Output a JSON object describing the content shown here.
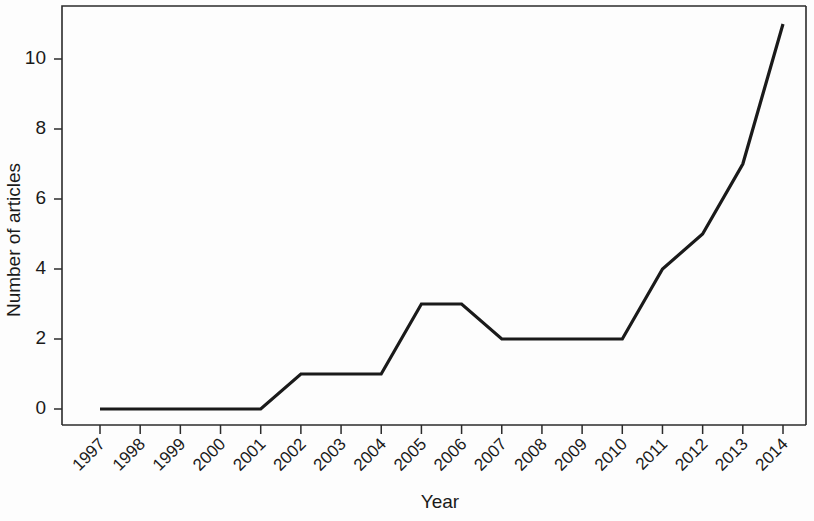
{
  "chart_data": {
    "type": "line",
    "title": "",
    "subtitle": "",
    "xlabel": "Year",
    "ylabel": "Number of articles",
    "categories": [
      "1997",
      "1998",
      "1999",
      "2000",
      "2001",
      "2002",
      "2003",
      "2004",
      "2005",
      "2006",
      "2007",
      "2008",
      "2009",
      "2010",
      "2011",
      "2012",
      "2013",
      "2014"
    ],
    "values": [
      0,
      0,
      0,
      0,
      0,
      1,
      1,
      1,
      3,
      3,
      2,
      2,
      2,
      2,
      4,
      5,
      7,
      11
    ],
    "series": [
      {
        "name": "Number of articles",
        "values": [
          0,
          0,
          0,
          0,
          0,
          1,
          1,
          1,
          3,
          3,
          2,
          2,
          2,
          2,
          4,
          5,
          7,
          11
        ]
      }
    ],
    "ylim": [
      0,
      11.7
    ],
    "xlim": [
      1997,
      2014
    ],
    "y_ticks": [
      0,
      2,
      4,
      6,
      8,
      10
    ],
    "y_tick_labels": [
      "0",
      "2",
      "4",
      "6",
      "8",
      "10"
    ],
    "x_tick_labels": [
      "1997",
      "1998",
      "1999",
      "2000",
      "2001",
      "2002",
      "2003",
      "2004",
      "2005",
      "2006",
      "2007",
      "2008",
      "2009",
      "2010",
      "2011",
      "2012",
      "2013",
      "2014"
    ],
    "x_tick_label_rotation": 45,
    "grid": false,
    "legend": false,
    "legend_position": "none",
    "line_color": "#1a1a1a",
    "line_width": 3.2,
    "background_color": "#fdfdfd",
    "axis_color": "#2b2b2b",
    "annotations": []
  },
  "figure": {
    "alt": "Line chart of number of articles per year from 1997 to 2014"
  }
}
